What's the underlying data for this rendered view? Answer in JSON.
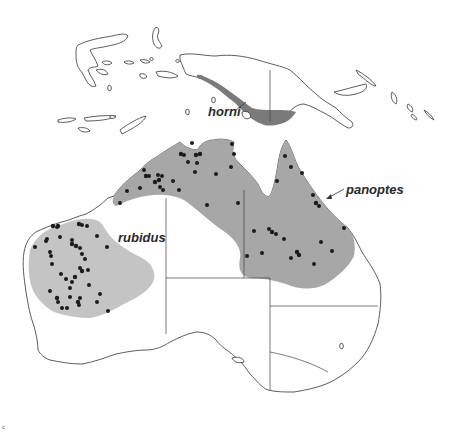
{
  "map": {
    "title": "",
    "region": "Australia and New Guinea",
    "colors": {
      "rubidus_range": "#c4c4c4",
      "panoptes_range": "#a7a7a7",
      "horni_range": "#7a7a7a",
      "locality_dots": "#1c1c1c",
      "outline": "#333333",
      "background": "#ffffff"
    },
    "labels": {
      "horni": "horni",
      "panoptes": "panoptes",
      "rubidus": "rubidus"
    },
    "corner_mark": "c"
  }
}
